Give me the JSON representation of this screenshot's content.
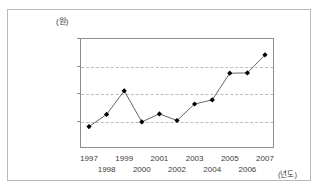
{
  "chart_data": {
    "type": "line",
    "title": "",
    "subtitle": "",
    "xlabel": "(년도)",
    "ylabel": "(원)",
    "x": [
      1997,
      1998,
      1999,
      2000,
      2001,
      2002,
      2003,
      2004,
      2005,
      2006,
      2007
    ],
    "categories": [
      "1997",
      "1998",
      "1999",
      "2000",
      "2001",
      "2002",
      "2003",
      "2004",
      "2005",
      "2006",
      "2007"
    ],
    "values": [
      7800,
      12200,
      20800,
      9500,
      12400,
      10000,
      16000,
      17500,
      27200,
      27300,
      33900
    ],
    "series": [
      {
        "name": "",
        "values": [
          7800,
          12200,
          20800,
          9500,
          12400,
          10000,
          16000,
          17500,
          27200,
          27300,
          33900
        ]
      }
    ],
    "ylim": [
      0,
      40000
    ],
    "xlim": [
      1997,
      2007
    ],
    "yticks": [
      10000,
      20000,
      30000,
      40000
    ],
    "ytick_labels": [
      "10,000",
      "20,000",
      "30,000",
      "40,000"
    ],
    "xtick_labels": [
      "1997",
      "1998",
      "1999",
      "2000",
      "2001",
      "2002",
      "2003",
      "2004",
      "2005",
      "2006",
      "2007"
    ],
    "grid": "horizontal-dashed",
    "legend": "none",
    "marker": "diamond",
    "line_color": "#555555",
    "marker_color": "#000000",
    "grid_color": "#bdbdbd",
    "axis_color": "#8d8d8d"
  },
  "axes": {
    "unit_label": "(원)",
    "x_axis_title": "(년도)"
  }
}
